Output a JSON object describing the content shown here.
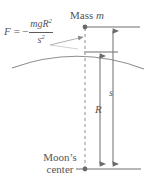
{
  "figure": {
    "name": "moon-gravity-diagram",
    "background_color": "#ffffff",
    "ink_color": "#555555"
  },
  "formula": {
    "lhs": "F",
    "equals": "=",
    "sign": "−",
    "numerator_m": "m",
    "numerator_g": "g",
    "numerator_g_subscript": "",
    "numerator_R": "R",
    "numerator_exponent": "2",
    "denominator_s": "s",
    "denominator_exponent": "2",
    "full_text": "F = − mgR² / s²"
  },
  "labels": {
    "mass_prefix": "Mass",
    "mass_symbol": "m",
    "radius_symbol": "R",
    "distance_symbol": "s",
    "moon_line1": "Moon’s",
    "moon_line2": "center"
  },
  "geometry": {
    "center_dashed_x": 85,
    "radius_line_x": 100,
    "distance_line_x": 113,
    "mass_point_y": 27,
    "surface_y": 52,
    "center_y": 169,
    "arc_peak_y": 50,
    "arc_left_x": 12,
    "arc_right_x": 144
  },
  "elements": {
    "mass_point": "mass-point-dot",
    "moon_center_point": "moon-center-dot",
    "top_horizontal_line": "mass-level-line",
    "surface_horizontal_tick": "surface-level-line",
    "bottom_horizontal_line": "center-level-line",
    "moon_surface_arc": "moon-surface-arc",
    "center_axis": "center-dashed-axis",
    "radius_dimension": "radius-dimension-arrow",
    "distance_dimension": "distance-dimension-arrow",
    "formula_leader": "formula-leader-line"
  }
}
